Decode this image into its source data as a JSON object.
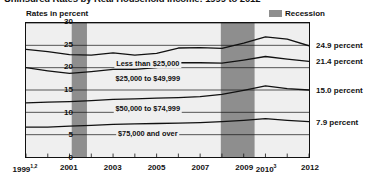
{
  "chart": {
    "title": "Uninsured Rates by Real Household Income: 1999 to 2012",
    "axis_caption": "Rates in percent",
    "legend_label": "Recession",
    "legend_color": "#8e8e8e"
  },
  "chart_data": {
    "type": "line",
    "title": "Uninsured Rates by Real Household Income: 1999 to 2012",
    "xlabel": "",
    "ylabel": "Rates in percent",
    "ylim": [
      0,
      30
    ],
    "xlim": [
      1999,
      2012
    ],
    "grid": true,
    "legend_position": "top-right",
    "yticks": [
      "0",
      "5",
      "10",
      "15",
      "20",
      "25",
      "30"
    ],
    "ytick_values": [
      0,
      5,
      10,
      15,
      20,
      25,
      30
    ],
    "xticks": [
      "1999",
      "2001",
      "2003",
      "2005",
      "2007",
      "2009",
      "2010",
      "2012"
    ],
    "xtick_values": [
      1999,
      2001,
      2003,
      2005,
      2007,
      2009,
      2010,
      2012
    ],
    "xtick_superscripts": [
      "1,2",
      "",
      "",
      "",
      "",
      "",
      "3",
      ""
    ],
    "x": [
      1999,
      2000,
      2001,
      2002,
      2003,
      2004,
      2005,
      2006,
      2007,
      2008,
      2009,
      2010,
      2011,
      2012
    ],
    "series": [
      {
        "name": "Less than $25,000",
        "label": "Less than $25,000",
        "end_value_label": "24.9 percent",
        "end_value": 24.9,
        "values": [
          24.1,
          23.6,
          22.9,
          22.8,
          23.3,
          22.8,
          23.2,
          24.4,
          24.5,
          24.3,
          25.5,
          26.9,
          26.4,
          24.9
        ]
      },
      {
        "name": "$25,000 to $49,999",
        "label": "$25,000 to $49,999",
        "end_value_label": "21.4 percent",
        "end_value": 21.4,
        "values": [
          20.0,
          19.3,
          18.7,
          19.1,
          19.6,
          19.6,
          20.0,
          21.1,
          21.1,
          21.0,
          21.7,
          22.5,
          21.9,
          21.4
        ]
      },
      {
        "name": "$50,000 to $74,999",
        "label": "$50,000 to $74,999",
        "end_value_label": "15.0 percent",
        "end_value": 15.0,
        "values": [
          12.1,
          12.3,
          12.4,
          12.6,
          12.9,
          13.0,
          13.2,
          13.3,
          13.5,
          14.0,
          14.9,
          15.9,
          15.3,
          15.0
        ]
      },
      {
        "name": "$75,000 and over",
        "label": "$75,000 and over",
        "end_value_label": "7.9 percent",
        "end_value": 7.9,
        "values": [
          6.7,
          6.7,
          6.9,
          7.1,
          7.3,
          7.4,
          7.5,
          7.6,
          7.7,
          7.9,
          8.2,
          8.6,
          8.2,
          7.9
        ]
      }
    ],
    "recession_bands": [
      {
        "label": "Recession",
        "start": 2001.1,
        "end": 2001.8
      },
      {
        "label": "Recession",
        "start": 2007.95,
        "end": 2009.5
      }
    ]
  }
}
